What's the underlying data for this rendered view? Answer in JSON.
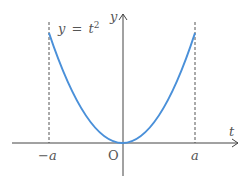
{
  "diagram": {
    "equation_label": "y = t²",
    "equation_lhs": "y",
    "equation_eq": "=",
    "equation_rhs_base": "t",
    "equation_rhs_exp": "2",
    "x_axis_label": "t",
    "y_axis_label": "y",
    "origin_label": "O",
    "neg_a_label": "−a",
    "neg_sign": "−",
    "neg_a_var": "a",
    "pos_a_label": "a",
    "curve_color": "#4a90d9",
    "axis_color": "#444444"
  }
}
